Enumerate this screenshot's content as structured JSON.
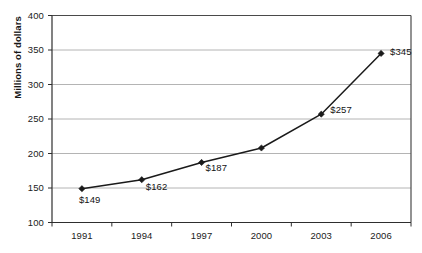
{
  "chart_data": {
    "type": "line",
    "title": "",
    "xlabel": "",
    "ylabel": "Millions of dollars",
    "categories": [
      "1991",
      "1994",
      "1997",
      "2000",
      "2003",
      "2006"
    ],
    "values": [
      149,
      162,
      187,
      208,
      257,
      345
    ],
    "point_labels": [
      "$149",
      "$162",
      "$187",
      "",
      "$257",
      "$345"
    ],
    "ylim": [
      100,
      400
    ],
    "ytick_labels": [
      "100",
      "150",
      "200",
      "250",
      "300",
      "350",
      "400"
    ],
    "ytick_values": [
      100,
      150,
      200,
      250,
      300,
      350,
      400
    ],
    "grid": "horizontal",
    "legend": "none",
    "series_color": "#1a1a1a",
    "marker": "diamond",
    "gridline_color": "#b4b4b4",
    "axis_color": "#4a4a4a",
    "background_color": "#ffffff"
  }
}
